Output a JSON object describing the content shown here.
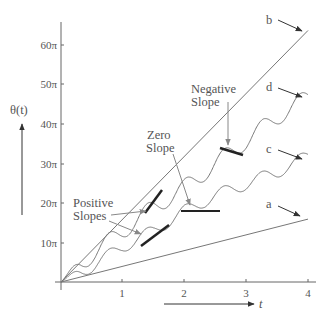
{
  "chart_data": {
    "type": "line",
    "title": "",
    "xlabel": "t",
    "ylabel": "θ(t)",
    "xlim": [
      0,
      4
    ],
    "ylim": [
      0,
      65
    ],
    "y_unit": "π",
    "grid": false,
    "legend": "none (inline letter labels with arrows)",
    "x_ticks": [
      "1",
      "2",
      "3",
      "4"
    ],
    "y_ticks": [
      "10π",
      "20π",
      "30π",
      "40π",
      "50π",
      "60π"
    ],
    "series": [
      {
        "name": "a",
        "kind": "straight line",
        "x": [
          0,
          4
        ],
        "y": [
          0,
          16
        ]
      },
      {
        "name": "b",
        "kind": "straight line",
        "x": [
          0,
          4
        ],
        "y": [
          0,
          64
        ]
      },
      {
        "name": "c",
        "kind": "oscillating curve (mean slope ~8π)",
        "x": [
          0,
          0.5,
          1,
          1.5,
          2,
          2.5,
          3,
          3.5,
          4
        ],
        "y": [
          0,
          4,
          9,
          13,
          18,
          22,
          25,
          28,
          32
        ]
      },
      {
        "name": "d",
        "kind": "oscillating curve (mean slope ~12π)",
        "x": [
          0,
          0.5,
          1,
          1.5,
          2,
          2.5,
          3,
          3.5,
          4
        ],
        "y": [
          0,
          7,
          13,
          19,
          24,
          30,
          36,
          42,
          47
        ]
      }
    ],
    "annotations": [
      {
        "text": "Positive Slopes",
        "points_to": "tangent segments on curves c and d near t≈1.5"
      },
      {
        "text": "Zero Slope",
        "points_to": "horizontal tangent on curve c near t≈2.1"
      },
      {
        "text": "Negative Slope",
        "points_to": "negative tangent on curve d near t≈2.8"
      }
    ]
  },
  "labels": {
    "ylabel": "θ(t)",
    "xlabel": "t",
    "series_a": "a",
    "series_b": "b",
    "series_c": "c",
    "series_d": "d",
    "pos_line1": "Positive",
    "pos_line2": "Slopes",
    "zero_line1": "Zero",
    "zero_line2": "Slope",
    "neg_line1": "Negative",
    "neg_line2": "Slope",
    "xt1": "1",
    "xt2": "2",
    "xt3": "3",
    "xt4": "4",
    "yt10": "10π",
    "yt20": "20π",
    "yt30": "30π",
    "yt40": "40π",
    "yt50": "50π",
    "yt60": "60π"
  }
}
